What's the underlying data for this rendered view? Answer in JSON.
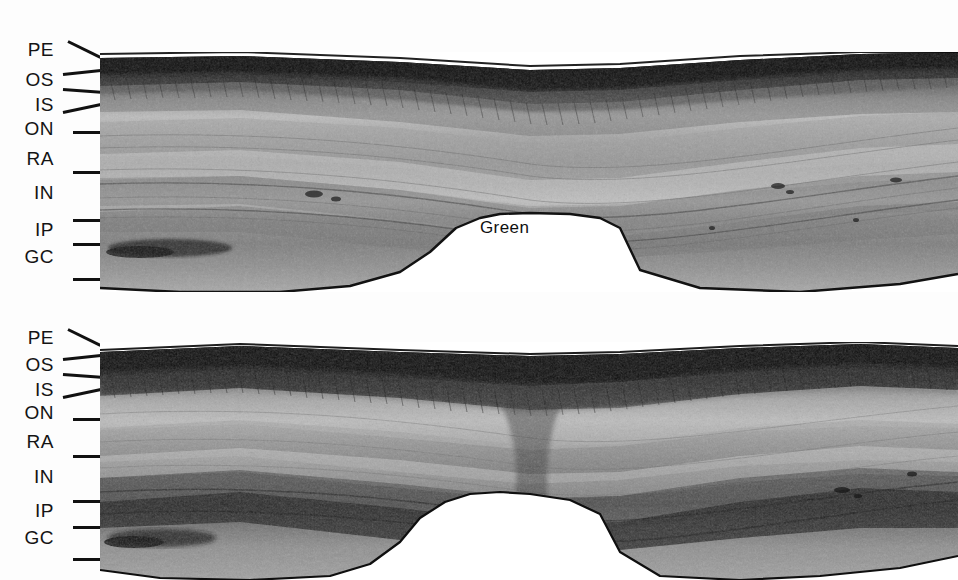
{
  "figure": {
    "panels": [
      {
        "id": "green",
        "caption": "Green",
        "layer_labels": [
          "PE",
          "OS",
          "IS",
          "ON",
          "RA",
          "IN",
          "IP",
          "GC"
        ]
      },
      {
        "id": "blue",
        "caption": "Blue",
        "layer_labels": [
          "PE",
          "OS",
          "IS",
          "ON",
          "RA",
          "IN",
          "IP",
          "GC"
        ]
      }
    ]
  },
  "panel_green": {
    "caption": "Green",
    "labels": [
      {
        "text": "PE",
        "y": 50
      },
      {
        "text": "OS",
        "y": 80
      },
      {
        "text": "IS",
        "y": 105
      },
      {
        "text": "ON",
        "y": 129
      },
      {
        "text": "RA",
        "y": 159
      },
      {
        "text": "IN",
        "y": 193
      },
      {
        "text": "IP",
        "y": 230
      },
      {
        "text": "GC",
        "y": 257
      }
    ],
    "ticks": [
      {
        "y": 40,
        "x": 68,
        "len": 36,
        "angle": 26
      },
      {
        "y": 73,
        "x": 63,
        "len": 38,
        "angle": -6
      },
      {
        "y": 88,
        "x": 63,
        "len": 38,
        "angle": 4
      },
      {
        "y": 111,
        "x": 63,
        "len": 40,
        "angle": -12
      },
      {
        "y": 131,
        "x": 73,
        "len": 28,
        "angle": 0
      },
      {
        "y": 171,
        "x": 73,
        "len": 28,
        "angle": 0
      },
      {
        "y": 219,
        "x": 73,
        "len": 28,
        "angle": 0
      },
      {
        "y": 243,
        "x": 73,
        "len": 28,
        "angle": 0
      },
      {
        "y": 278,
        "x": 73,
        "len": 28,
        "angle": 0
      }
    ]
  },
  "panel_blue": {
    "caption": "Blue",
    "labels": [
      {
        "text": "PE",
        "y": 38
      },
      {
        "text": "OS",
        "y": 65
      },
      {
        "text": "IS",
        "y": 90
      },
      {
        "text": "ON",
        "y": 113
      },
      {
        "text": "RA",
        "y": 142
      },
      {
        "text": "IN",
        "y": 177
      },
      {
        "text": "IP",
        "y": 211
      },
      {
        "text": "GC",
        "y": 238
      }
    ],
    "ticks": [
      {
        "y": 28,
        "x": 68,
        "len": 36,
        "angle": 26
      },
      {
        "y": 58,
        "x": 63,
        "len": 38,
        "angle": -6
      },
      {
        "y": 73,
        "x": 63,
        "len": 38,
        "angle": 4
      },
      {
        "y": 96,
        "x": 63,
        "len": 40,
        "angle": -12
      },
      {
        "y": 118,
        "x": 73,
        "len": 28,
        "angle": 0
      },
      {
        "y": 155,
        "x": 73,
        "len": 28,
        "angle": 0
      },
      {
        "y": 200,
        "x": 73,
        "len": 28,
        "angle": 0
      },
      {
        "y": 226,
        "x": 73,
        "len": 28,
        "angle": 0
      },
      {
        "y": 258,
        "x": 73,
        "len": 28,
        "angle": 0
      }
    ]
  },
  "colors": {
    "ink": "#111111",
    "page": "#ffffff",
    "tissue_dark": "#1a1a1a",
    "tissue_mid": "#8d8d8d",
    "tissue_light": "#d8d8d8"
  },
  "layer_key": {
    "PE": "pigment epithelium",
    "OS": "outer segments",
    "IS": "inner segments",
    "ON": "outer nuclear layer",
    "RA": "receptor axons",
    "IN": "inner nuclear layer",
    "IP": "inner plexiform layer",
    "GC": "ganglion cell layer"
  }
}
